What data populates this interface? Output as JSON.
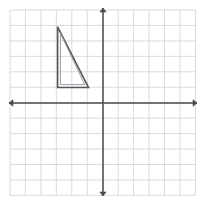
{
  "figure": {
    "width": 206,
    "height": 204,
    "background_color": "#ffffff"
  },
  "grid": {
    "color": "#d6d6dc",
    "line_width": 0.9,
    "origin_px": {
      "x": 103.0,
      "y": 103.0
    },
    "cell_size_px": 15.45,
    "left_px": 10.0,
    "right_px": 195.4,
    "top_px": 10.0,
    "bottom_px": 195.4,
    "columns": 12,
    "rows": 12,
    "x_range": [
      -6,
      6
    ],
    "y_range": [
      -6,
      6
    ],
    "visible": true
  },
  "axes": {
    "color": "#4a4a52",
    "line_width": 1.5,
    "arrowheads": true,
    "x_axis": {
      "label": "x-axis",
      "y_px": 103.0,
      "start_px": 9.0,
      "end_px": 197.0
    },
    "y_axis": {
      "label": "y-axis",
      "x_px": 103.0,
      "start_px": 8.0,
      "end_px": 196.0
    },
    "tick_labels": [],
    "origin_label": ""
  },
  "shape": {
    "name": "right-triangle",
    "type": "polygon",
    "quadrant": "second",
    "outer_stroke_color": "#55555d",
    "inner_stroke_color": "#9a9aa4",
    "outer_line_width": 1.6,
    "inner_line_width": 1.0,
    "fill": "none",
    "vertices_grid": [
      {
        "label": "A",
        "x": -3,
        "y": 5
      },
      {
        "label": "B",
        "x": -3,
        "y": 1
      },
      {
        "label": "C",
        "x": -1,
        "y": 1
      }
    ],
    "vertices_px": [
      {
        "label": "A",
        "x": 57.6,
        "y": 26.8
      },
      {
        "label": "B",
        "x": 57.6,
        "y": 87.5
      },
      {
        "label": "C",
        "x": 88.5,
        "y": 87.5
      }
    ],
    "inner_vertices_px": [
      {
        "label": "A2",
        "x": 60.4,
        "y": 33.0
      },
      {
        "label": "B2",
        "x": 60.4,
        "y": 84.6
      },
      {
        "label": "C2",
        "x": 84.7,
        "y": 84.6
      }
    ],
    "vertex_labels_visible": false
  },
  "chart_data": {
    "type": "scatter",
    "title": "",
    "xlabel": "",
    "ylabel": "",
    "xlim": [
      -6,
      6
    ],
    "ylim": [
      -6,
      6
    ],
    "grid": true,
    "legend": "none",
    "series": [
      {
        "name": "right-triangle",
        "kind": "polygon",
        "closed": true,
        "x": [
          -3,
          -3,
          -1,
          -3
        ],
        "y": [
          5,
          1,
          1,
          5
        ]
      }
    ],
    "annotations": []
  }
}
